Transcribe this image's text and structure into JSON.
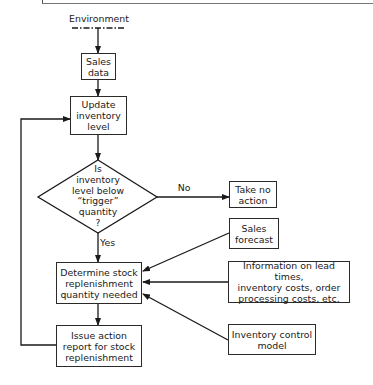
{
  "diagram": {
    "type": "flowchart",
    "source": {
      "label": "Environment"
    },
    "nodes": {
      "sales_data": "Sales\ndata",
      "update_inventory": "Update\ninventory\nlevel",
      "decision": "Is\ninventory\nlevel below\n“trigger”\nquantity\n?",
      "take_no_action": "Take no\naction",
      "sales_forecast": "Sales\nforecast",
      "determine_quantity": "Determine stock\nreplenishment\nquantity needed",
      "information": "Information on lead times,\ninventory costs, order\nprocessing costs, etc.",
      "issue_report": "Issue action\nreport for stock\nreplenishment",
      "inventory_model": "Inventory control\nmodel"
    },
    "edge_labels": {
      "no": "No",
      "yes": "Yes"
    },
    "edges": [
      [
        "Environment",
        "Sales data"
      ],
      [
        "Sales data",
        "Update inventory level"
      ],
      [
        "Update inventory level",
        "Decision"
      ],
      [
        "Decision",
        "Take no action",
        "No"
      ],
      [
        "Decision",
        "Determine stock replenishment quantity needed",
        "Yes"
      ],
      [
        "Sales forecast",
        "Determine stock replenishment quantity needed"
      ],
      [
        "Information on lead times, inventory costs, order processing costs, etc.",
        "Determine stock replenishment quantity needed"
      ],
      [
        "Inventory control model",
        "Determine stock replenishment quantity needed"
      ],
      [
        "Determine stock replenishment quantity needed",
        "Issue action report for stock replenishment"
      ],
      [
        "Issue action report for stock replenishment",
        "Update inventory level"
      ]
    ]
  }
}
